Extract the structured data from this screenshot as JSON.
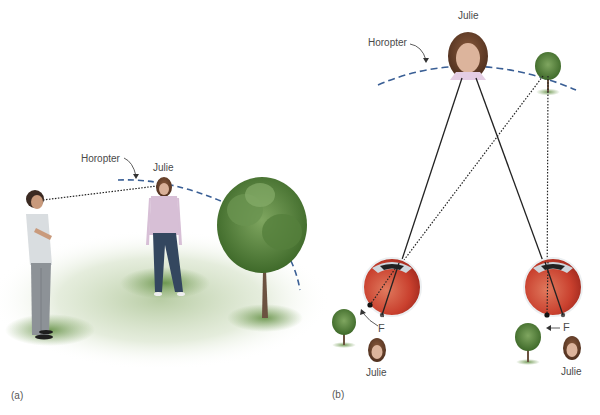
{
  "figure": {
    "panel_a": {
      "label": "(a)",
      "horopter_label": "Horopter",
      "person_label": "Julie"
    },
    "panel_b": {
      "label": "(b)",
      "horopter_label": "Horopter",
      "person_label_top": "Julie",
      "left_eye": {
        "fovea_label": "F",
        "image_label": "Julie"
      },
      "right_eye": {
        "fovea_label": "F",
        "image_label": "Julie"
      }
    },
    "colors": {
      "horopter_dash": "#3a5f95",
      "sight_line": "#222222",
      "eye_red": "#c9402e",
      "ground_green": "#6f9a4e",
      "tree_green": "#4f7a36",
      "shirt_pink": "#d7bfd6",
      "jeans_blue": "#34475f"
    }
  }
}
